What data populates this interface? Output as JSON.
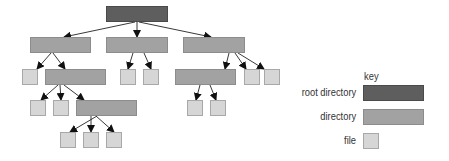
{
  "key": {
    "title": "key",
    "items": [
      {
        "label": "root directory",
        "type": "root",
        "color": "#5e5e5e"
      },
      {
        "label": "directory",
        "type": "dir",
        "color": "#a2a2a2"
      },
      {
        "label": "file",
        "type": "file",
        "color": "#d6d6d6"
      }
    ]
  },
  "tree": {
    "root": {
      "type": "root",
      "children": [
        {
          "type": "dir",
          "children": [
            {
              "type": "file"
            },
            {
              "type": "dir",
              "children": [
                {
                  "type": "file"
                },
                {
                  "type": "file"
                },
                {
                  "type": "dir",
                  "children": [
                    {
                      "type": "file"
                    },
                    {
                      "type": "file"
                    },
                    {
                      "type": "file"
                    }
                  ]
                }
              ]
            }
          ]
        },
        {
          "type": "dir",
          "children": [
            {
              "type": "file"
            },
            {
              "type": "file"
            }
          ]
        },
        {
          "type": "dir",
          "children": [
            {
              "type": "dir",
              "children": [
                {
                  "type": "file"
                },
                {
                  "type": "file"
                }
              ]
            },
            {
              "type": "file"
            },
            {
              "type": "file"
            }
          ]
        }
      ]
    }
  }
}
